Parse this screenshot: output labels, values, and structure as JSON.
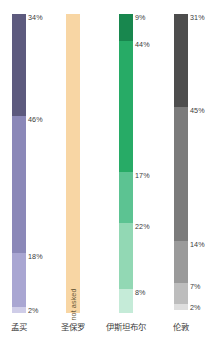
{
  "chart_data": {
    "type": "bar",
    "title": "",
    "subtitle": "",
    "xlabel": "",
    "ylabel": "",
    "ylim": [
      0,
      100
    ],
    "grid": false,
    "legend": "none",
    "orientation": "vertical-stacked",
    "categories": [
      "孟买",
      "圣保罗",
      "伊斯坦布尔",
      "伦敦"
    ],
    "note_text": "not asked",
    "series": [
      {
        "name": "孟买",
        "label": "孟买",
        "color_family": "#5d5a7e",
        "not_asked": false,
        "note": "",
        "segments": [
          {
            "label": "34%",
            "value": 34,
            "color": "#5d5a7e"
          },
          {
            "label": "46%",
            "value": 46,
            "color": "#8b88b8"
          },
          {
            "label": "18%",
            "value": 18,
            "color": "#a9a6d2"
          },
          {
            "label": "2%",
            "value": 2,
            "color": "#cfcde8"
          }
        ]
      },
      {
        "name": "圣保罗",
        "label": "圣保罗",
        "color_family": "#f8d6a4",
        "not_asked": true,
        "note": "not asked",
        "segments": [
          {
            "label": "",
            "value": 100,
            "color": "#f8d6a4"
          }
        ]
      },
      {
        "name": "伊斯坦布尔",
        "label": "伊斯坦布尔",
        "color_family": "#27ab66",
        "not_asked": false,
        "note": "",
        "segments": [
          {
            "label": "9%",
            "value": 9,
            "color": "#18874e"
          },
          {
            "label": "44%",
            "value": 44,
            "color": "#27ab66"
          },
          {
            "label": "17%",
            "value": 17,
            "color": "#5cc392"
          },
          {
            "label": "22%",
            "value": 22,
            "color": "#92d8b4"
          },
          {
            "label": "8%",
            "value": 8,
            "color": "#c5ebd8"
          }
        ]
      },
      {
        "name": "伦敦",
        "label": "伦敦",
        "color_family": "#5a5a5a",
        "not_asked": false,
        "note": "",
        "segments": [
          {
            "label": "31%",
            "value": 31,
            "color": "#4d4d4d"
          },
          {
            "label": "45%",
            "value": 45,
            "color": "#7b7b7b"
          },
          {
            "label": "14%",
            "value": 14,
            "color": "#9a9a9a"
          },
          {
            "label": "7%",
            "value": 7,
            "color": "#bdbdbd"
          },
          {
            "label": "2%",
            "value": 2,
            "color": "#dedede"
          }
        ]
      }
    ]
  },
  "layout": {
    "bar_left_positions": [
      12,
      66,
      119,
      174
    ],
    "bar_width": 14,
    "stack_top": 14,
    "stack_height": 299
  }
}
